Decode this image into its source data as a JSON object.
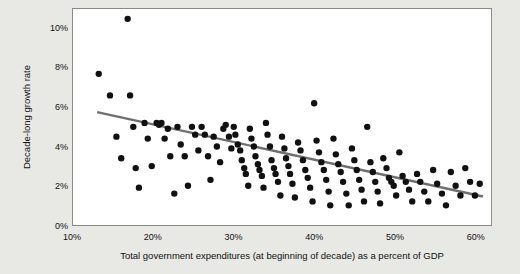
{
  "chart_data": {
    "type": "scatter",
    "title": "",
    "xlabel": "Total government expenditures (at beginning of decade) as a percent of GDP",
    "ylabel": "Decade-long growth rate",
    "xlim": [
      10,
      62
    ],
    "ylim": [
      0,
      11
    ],
    "xticks": [
      "10%",
      "20%",
      "30%",
      "40%",
      "50%",
      "60%"
    ],
    "xtick_values": [
      10,
      20,
      30,
      40,
      50,
      60
    ],
    "yticks": [
      "0%",
      "2%",
      "4%",
      "6%",
      "8%",
      "10%"
    ],
    "ytick_values": [
      0,
      2,
      4,
      6,
      8,
      10
    ],
    "grid": false,
    "legend": "none",
    "series": [
      {
        "name": "Countries",
        "marker": "circle",
        "color": "#111111",
        "points": [
          [
            13.2,
            7.7
          ],
          [
            14.6,
            6.6
          ],
          [
            15.4,
            4.5
          ],
          [
            16.0,
            3.4
          ],
          [
            16.8,
            10.5
          ],
          [
            17.1,
            6.6
          ],
          [
            17.5,
            5.0
          ],
          [
            17.8,
            2.9
          ],
          [
            18.2,
            1.9
          ],
          [
            18.9,
            5.2
          ],
          [
            19.3,
            4.4
          ],
          [
            19.8,
            3.0
          ],
          [
            20.4,
            5.2
          ],
          [
            20.7,
            5.1
          ],
          [
            21.0,
            5.2
          ],
          [
            21.4,
            4.4
          ],
          [
            21.8,
            4.9
          ],
          [
            22.1,
            3.5
          ],
          [
            22.6,
            1.6
          ],
          [
            23.0,
            5.0
          ],
          [
            23.4,
            4.1
          ],
          [
            23.9,
            3.5
          ],
          [
            24.3,
            2.0
          ],
          [
            24.8,
            5.0
          ],
          [
            25.2,
            4.6
          ],
          [
            25.6,
            3.8
          ],
          [
            26.0,
            5.0
          ],
          [
            26.4,
            4.6
          ],
          [
            26.8,
            3.5
          ],
          [
            27.1,
            2.3
          ],
          [
            27.5,
            4.5
          ],
          [
            27.9,
            4.0
          ],
          [
            28.3,
            3.2
          ],
          [
            28.7,
            4.9
          ],
          [
            29.0,
            5.1
          ],
          [
            29.4,
            4.5
          ],
          [
            29.7,
            3.9
          ],
          [
            30.0,
            5.0
          ],
          [
            30.2,
            4.6
          ],
          [
            30.5,
            4.1
          ],
          [
            30.8,
            3.8
          ],
          [
            31.0,
            3.3
          ],
          [
            31.3,
            2.9
          ],
          [
            31.5,
            2.6
          ],
          [
            31.8,
            2.0
          ],
          [
            32.0,
            4.9
          ],
          [
            32.2,
            4.4
          ],
          [
            32.5,
            4.0
          ],
          [
            32.7,
            3.5
          ],
          [
            33.0,
            3.1
          ],
          [
            33.2,
            2.8
          ],
          [
            33.5,
            2.5
          ],
          [
            33.7,
            1.9
          ],
          [
            34.0,
            5.2
          ],
          [
            34.2,
            4.6
          ],
          [
            34.5,
            4.0
          ],
          [
            34.7,
            3.3
          ],
          [
            35.0,
            2.9
          ],
          [
            35.2,
            2.6
          ],
          [
            35.5,
            2.2
          ],
          [
            35.8,
            1.5
          ],
          [
            36.0,
            4.5
          ],
          [
            36.3,
            3.9
          ],
          [
            36.5,
            3.4
          ],
          [
            36.8,
            3.0
          ],
          [
            37.0,
            2.6
          ],
          [
            37.3,
            2.1
          ],
          [
            37.6,
            1.4
          ],
          [
            38.0,
            4.2
          ],
          [
            38.3,
            3.8
          ],
          [
            38.6,
            3.3
          ],
          [
            38.9,
            2.8
          ],
          [
            39.2,
            2.4
          ],
          [
            39.5,
            1.9
          ],
          [
            39.8,
            1.2
          ],
          [
            40.0,
            6.2
          ],
          [
            40.3,
            4.3
          ],
          [
            40.6,
            3.7
          ],
          [
            40.9,
            3.2
          ],
          [
            41.2,
            2.8
          ],
          [
            41.5,
            2.3
          ],
          [
            41.8,
            1.7
          ],
          [
            42.0,
            1.0
          ],
          [
            42.4,
            4.4
          ],
          [
            42.7,
            3.6
          ],
          [
            43.0,
            3.1
          ],
          [
            43.3,
            2.7
          ],
          [
            43.6,
            2.2
          ],
          [
            44.0,
            1.6
          ],
          [
            44.3,
            1.0
          ],
          [
            44.7,
            3.9
          ],
          [
            45.0,
            3.3
          ],
          [
            45.3,
            2.8
          ],
          [
            45.6,
            2.3
          ],
          [
            45.9,
            1.8
          ],
          [
            46.2,
            1.2
          ],
          [
            46.6,
            5.0
          ],
          [
            47.0,
            3.2
          ],
          [
            47.3,
            2.7
          ],
          [
            47.6,
            2.2
          ],
          [
            47.9,
            1.7
          ],
          [
            48.2,
            1.1
          ],
          [
            48.6,
            3.4
          ],
          [
            49.0,
            2.9
          ],
          [
            49.3,
            2.4
          ],
          [
            49.6,
            2.2
          ],
          [
            49.9,
            2.0
          ],
          [
            50.2,
            1.5
          ],
          [
            50.6,
            3.7
          ],
          [
            51.0,
            2.5
          ],
          [
            51.4,
            2.2
          ],
          [
            51.8,
            1.8
          ],
          [
            52.2,
            1.2
          ],
          [
            52.8,
            2.6
          ],
          [
            53.2,
            2.2
          ],
          [
            53.7,
            1.7
          ],
          [
            54.2,
            1.2
          ],
          [
            54.8,
            2.8
          ],
          [
            55.3,
            2.1
          ],
          [
            55.9,
            1.6
          ],
          [
            56.4,
            1.0
          ],
          [
            57.0,
            2.7
          ],
          [
            57.6,
            2.0
          ],
          [
            58.2,
            1.5
          ],
          [
            58.8,
            2.9
          ],
          [
            59.4,
            2.2
          ],
          [
            60.0,
            1.5
          ],
          [
            60.6,
            2.1
          ]
        ]
      }
    ],
    "trendline": {
      "name": "Linear fit",
      "color": "#6f6f6f",
      "x_start": 13.0,
      "y_start": 5.75,
      "x_end": 61.0,
      "y_end": 1.45
    }
  }
}
